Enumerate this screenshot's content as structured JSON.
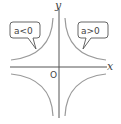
{
  "diagram": {
    "type": "inverse-proportion-graph",
    "axes": {
      "x_label": "x",
      "y_label": "y",
      "origin_label": "O"
    },
    "callouts": [
      {
        "label": "a<0",
        "quadrants": [
          "II",
          "IV"
        ]
      },
      {
        "label": "a>0",
        "quadrants": [
          "I",
          "III"
        ]
      }
    ],
    "colors": {
      "axis": "#555555",
      "curve": "#9a9a9a",
      "text": "#444444"
    }
  }
}
